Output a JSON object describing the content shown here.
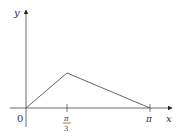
{
  "diagram": {
    "type": "function-graph",
    "axes": {
      "x_label": "x",
      "y_label": "y",
      "origin_label": "0"
    },
    "ticks": [
      {
        "label_num": "π",
        "label_den": "3",
        "value": "π/3"
      },
      {
        "label": "π",
        "value": "π"
      }
    ],
    "polyline": [
      {
        "x": "0",
        "y": "0"
      },
      {
        "x": "π/3",
        "y": "peak"
      },
      {
        "x": "π",
        "y": "0"
      }
    ],
    "colors": {
      "axis": "#444444",
      "curve": "#555555",
      "text": "#333333"
    }
  }
}
